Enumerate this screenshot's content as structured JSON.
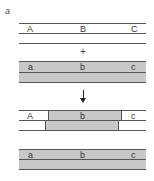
{
  "panel": {
    "label": "a"
  },
  "colors": {
    "shade": "#c8c8c8",
    "line": "#555555",
    "background": "#ffffff"
  },
  "strand1": {
    "labels": [
      "A",
      "B",
      "C"
    ],
    "shaded": false
  },
  "operator": {
    "symbol": "+"
  },
  "strand2": {
    "labels": [
      "a",
      "b",
      "c"
    ],
    "shaded": true
  },
  "arrow": {
    "direction": "down"
  },
  "heteroduplex": {
    "labels": [
      "A",
      "b",
      "c"
    ]
  },
  "product": {
    "labels": [
      "a",
      "b",
      "c"
    ],
    "shaded": true
  }
}
